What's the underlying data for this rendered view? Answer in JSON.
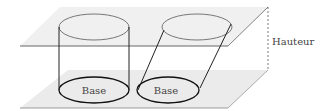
{
  "diagram": {
    "labels": {
      "left_base": "Base",
      "right_base": "Base",
      "height": "Hauteur"
    },
    "colors": {
      "plane_fill": "#eeeeee",
      "plane_edge": "#777777",
      "solid_line": "#222222",
      "hidden_line": "#888888"
    },
    "shapes": [
      {
        "id": "right-cylinder",
        "type": "cylindre droit"
      },
      {
        "id": "oblique-cylinder",
        "type": "cylindre oblique"
      }
    ]
  }
}
